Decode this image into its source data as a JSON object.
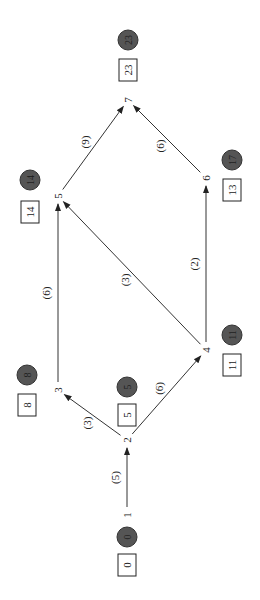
{
  "diagram": {
    "type": "network",
    "orientation": "rotated 90deg",
    "nodes": [
      {
        "id": "1",
        "label": "1",
        "box": "0",
        "circle": "0"
      },
      {
        "id": "2",
        "label": "2",
        "box": "5",
        "circle": "5"
      },
      {
        "id": "3",
        "label": "3",
        "box": "8",
        "circle": "8"
      },
      {
        "id": "4",
        "label": "4",
        "box": "11",
        "circle": "11"
      },
      {
        "id": "5",
        "label": "5",
        "box": "14",
        "circle": "14"
      },
      {
        "id": "6",
        "label": "6",
        "box": "13",
        "circle": "17"
      },
      {
        "id": "7",
        "label": "7",
        "box": "23",
        "circle": "23"
      }
    ],
    "edges": [
      {
        "from": "1",
        "to": "2",
        "weight": "(5)"
      },
      {
        "from": "2",
        "to": "3",
        "weight": "(3)"
      },
      {
        "from": "2",
        "to": "4",
        "weight": "(6)"
      },
      {
        "from": "3",
        "to": "5",
        "weight": "(6)"
      },
      {
        "from": "4",
        "to": "5",
        "weight": "(3)"
      },
      {
        "from": "4",
        "to": "6",
        "weight": "(2)"
      },
      {
        "from": "5",
        "to": "7",
        "weight": "(9)"
      },
      {
        "from": "6",
        "to": "7",
        "weight": "(6)"
      }
    ]
  }
}
